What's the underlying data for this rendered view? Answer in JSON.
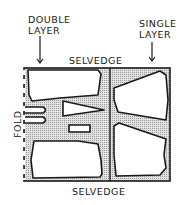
{
  "diagram": {
    "labels": {
      "double_layer": "DOUBLE\nLAYER",
      "single_layer": "SINGLE\nLAYER",
      "selvedge_top": "SELVEDGE",
      "selvedge_bottom": "SELVEDGE",
      "fold": "FOLD"
    },
    "colors": {
      "ink": "#1a1a1a",
      "fabric_fill": "#cfcfcf",
      "piece_fill": "#ffffff"
    },
    "regions": [
      {
        "name": "double-layer-area",
        "pieces": [
          "upper-bodice-piece",
          "sleeve-darts",
          "triangle-piece",
          "small-rectangle-piece",
          "lower-bodice-piece"
        ]
      },
      {
        "name": "single-layer-area",
        "pieces": [
          "upper-right-piece",
          "lower-right-piece"
        ]
      }
    ]
  }
}
